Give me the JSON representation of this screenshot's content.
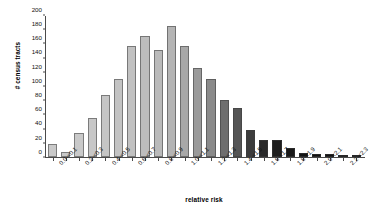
{
  "chart_data": {
    "type": "bar",
    "title": "",
    "xlabel": "relative risk",
    "ylabel": "# census tracts",
    "ylim": [
      0,
      200
    ],
    "yticks": [
      0,
      20,
      40,
      60,
      80,
      100,
      120,
      140,
      160,
      180,
      200
    ],
    "grid": false,
    "legend": null,
    "categories": [
      "0.0-<0.1",
      "0.1-<0.2",
      "0.2-<0.3",
      "0.3-<0.4",
      "0.4-<0.5",
      "0.5-<0.6",
      "0.6-<0.7",
      "0.7-<0.8",
      "0.8-<0.9",
      "0.9-<1.0",
      "1.0-<1.1",
      "1.1-<1.2",
      "1.2-<1.3",
      "1.3-<1.4",
      "1.4-<1.5",
      "1.5-<1.6",
      "1.6-<1.7",
      "1.7-<1.8",
      "1.8-<1.9",
      "1.9-<2.0",
      "2.0-<2.1",
      "2.1-<2.2",
      "2.2-<2.3",
      "2.3-<2.4"
    ],
    "visible_tick_labels": [
      "0.0-<0.1",
      "0.2-<0.3",
      "0.4-<0.5",
      "0.6-<0.7",
      "0.8-<0.9",
      "1.0-<1.1",
      "1.2-<1.3",
      "1.4-<1.5",
      "1.6-<1.7",
      "1.8-<1.9",
      "2.0-<2.1",
      "2.2-<2.3"
    ],
    "values": [
      19,
      7,
      34,
      55,
      88,
      110,
      158,
      171,
      152,
      186,
      157,
      126,
      110,
      81,
      70,
      38,
      24,
      24,
      13,
      5,
      4,
      4,
      2,
      1
    ],
    "bar_colors": [
      "#c9c9c9",
      "#c9c9c9",
      "#c9c9c9",
      "#c7c7c7",
      "#c5c5c5",
      "#c3c3c3",
      "#c1c1c1",
      "#bdbdbd",
      "#bababa",
      "#b4b4b4",
      "#a8a8a8",
      "#9a9a9a",
      "#8a8a8a",
      "#6e6e6e",
      "#555555",
      "#3c3c3c",
      "#2a2a2a",
      "#1e1e1e",
      "#181818",
      "#141414",
      "#121212",
      "#111111",
      "#101010",
      "#101010"
    ],
    "axis_color": "#4a4a4a"
  }
}
